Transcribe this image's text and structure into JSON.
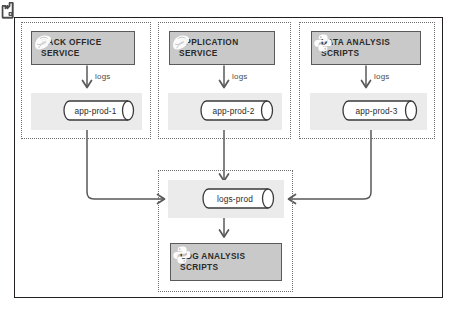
{
  "diagram": {
    "colors": {
      "frame_border": "#231f20",
      "group_border": "#6f6f6f",
      "service_box_fill": "#c9c9c9",
      "service_box_border": "#5a5a5a",
      "host_band_fill": "#ebebeb",
      "cylinder_stroke": "#3a3a3a",
      "connector_stroke": "#58585a",
      "text": "#2a2a2a"
    },
    "groups": [
      {
        "name": "back-office-group",
        "service": {
          "label": "BACK OFFICE\nSERVICE",
          "icon": "ruby-gem-icon"
        },
        "edge_label": "logs",
        "host": {
          "name": "app-prod-1",
          "icon": "factory-icon"
        }
      },
      {
        "name": "application-group",
        "service": {
          "label": "APPLICATION\nSERVICE",
          "icon": "ruby-gem-icon"
        },
        "edge_label": "logs",
        "host": {
          "name": "app-prod-2",
          "icon": "factory-icon"
        }
      },
      {
        "name": "data-analysis-group",
        "service": {
          "label": "DATA ANALYSIS\nSCRIPTS",
          "icon": "python-icon"
        },
        "edge_label": "logs",
        "host": {
          "name": "app-prod-3",
          "icon": "factory-icon"
        }
      }
    ],
    "log_group": {
      "name": "log-analysis-group",
      "host": {
        "name": "logs-prod",
        "icon": "factory-icon"
      },
      "service": {
        "label": "LOG ANALYSIS\nSCRIPTS",
        "icon": "python-icon"
      }
    },
    "connectors": [
      {
        "name": "app-prod-1-to-logs-prod",
        "from": "app-prod-1",
        "to": "logs-prod",
        "arrow": "chevron-right"
      },
      {
        "name": "app-prod-2-to-logs-prod",
        "from": "app-prod-2",
        "to": "logs-prod",
        "arrow": "chevron-down"
      },
      {
        "name": "app-prod-3-to-logs-prod",
        "from": "app-prod-3",
        "to": "logs-prod",
        "arrow": "chevron-left"
      },
      {
        "name": "logs-prod-to-log-analysis",
        "from": "logs-prod",
        "to": "LOG ANALYSIS SCRIPTS",
        "arrow": "chevron-down"
      }
    ]
  }
}
